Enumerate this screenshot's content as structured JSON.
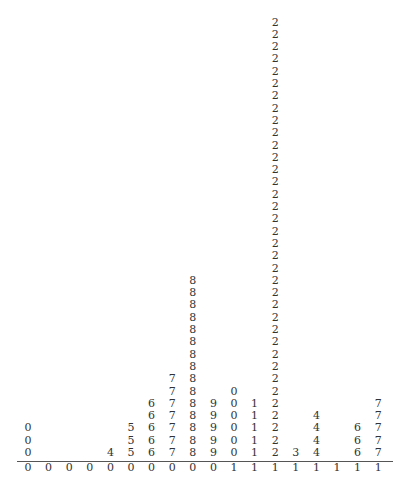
{
  "chart_data": {
    "type": "dotplot",
    "title": "",
    "xlabel": "",
    "ylabel": "",
    "grid": false,
    "legend": null,
    "columns": [
      {
        "stem": "0",
        "leaf": "0",
        "count": 3
      },
      {
        "stem": "0",
        "leaf": "1",
        "count": 0
      },
      {
        "stem": "0",
        "leaf": "2",
        "count": 0
      },
      {
        "stem": "0",
        "leaf": "3",
        "count": 0
      },
      {
        "stem": "0",
        "leaf": "4",
        "count": 1
      },
      {
        "stem": "0",
        "leaf": "5",
        "count": 3
      },
      {
        "stem": "0",
        "leaf": "6",
        "count": 5
      },
      {
        "stem": "0",
        "leaf": "7",
        "count": 7
      },
      {
        "stem": "0",
        "leaf": "8",
        "count": 15
      },
      {
        "stem": "0",
        "leaf": "9",
        "count": 5
      },
      {
        "stem": "1",
        "leaf": "0",
        "count": 6
      },
      {
        "stem": "1",
        "leaf": "1",
        "count": 5
      },
      {
        "stem": "1",
        "leaf": "2",
        "count": 36
      },
      {
        "stem": "1",
        "leaf": "3",
        "count": 1
      },
      {
        "stem": "1",
        "leaf": "4",
        "count": 4
      },
      {
        "stem": "1",
        "leaf": "5",
        "count": 0
      },
      {
        "stem": "1",
        "leaf": "6",
        "count": 3
      },
      {
        "stem": "1",
        "leaf": "7",
        "count": 5
      }
    ],
    "categories": [
      "0",
      "1",
      "2",
      "3",
      "4",
      "5",
      "6",
      "7",
      "8",
      "9",
      "10",
      "11",
      "12",
      "13",
      "14",
      "15",
      "16",
      "17"
    ],
    "values": [
      3,
      0,
      0,
      0,
      1,
      3,
      5,
      7,
      15,
      5,
      6,
      5,
      36,
      1,
      4,
      0,
      3,
      5
    ]
  },
  "layout": {
    "first_x": 28,
    "col_spacing": 20.6,
    "baseline_y": 453,
    "row_spacing": 12.3,
    "stem_y": 468,
    "text_color": "#333333",
    "axis_color": "#555555"
  }
}
